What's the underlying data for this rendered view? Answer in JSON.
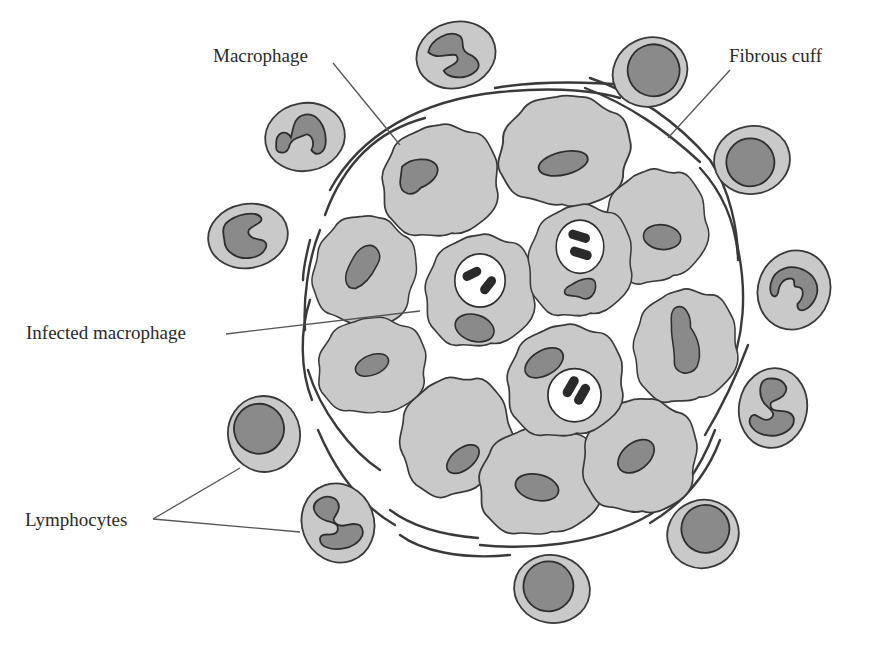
{
  "diagram": {
    "labels": {
      "macrophage": "Macrophage",
      "fibrous_cuff": "Fibrous cuff",
      "infected_macrophage": "Infected macrophage",
      "lymphocytes": "Lymphocytes"
    },
    "colors": {
      "background": "#ffffff",
      "cytoplasm": "#c9c9c9",
      "nucleus": "#8a8a8a",
      "outline": "#3a3a3a",
      "bacteria": "#2a2a2a",
      "vacuole": "#ffffff",
      "text": "#2a2a2a"
    },
    "components": {
      "macrophages_count": 13,
      "infected_macrophages_count": 3,
      "peripheral_cells_count": 12
    }
  }
}
